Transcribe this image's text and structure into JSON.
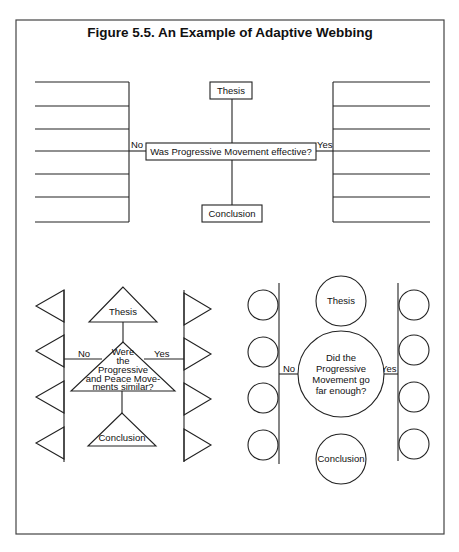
{
  "figure": {
    "title": "Figure 5.5.  An Example of Adaptive Webbing"
  },
  "web_rectangles": {
    "thesis": "Thesis",
    "question": "Was Progressive Movement effective?",
    "conclusion": "Conclusion",
    "no_label": "No",
    "yes_label": "Yes",
    "left_lines_count": 7,
    "right_lines_count": 7
  },
  "web_triangles": {
    "thesis": "Thesis",
    "question_lines": [
      "Were",
      "the",
      "Progressive",
      "and Peace Move-",
      "ments similar?"
    ],
    "conclusion": "Conclusion",
    "no_label": "No",
    "yes_label": "Yes",
    "left_triangles_count": 4,
    "right_triangles_count": 4
  },
  "web_circles": {
    "thesis": "Thesis",
    "question_lines": [
      "Did the",
      "Progressive",
      "Movement go",
      "far enough?"
    ],
    "conclusion": "Conclusion",
    "no_label": "No",
    "yes_label": "Yes",
    "left_circles_count": 4,
    "right_circles_count": 4
  },
  "colors": {
    "ink": "#222222",
    "background": "#ffffff"
  }
}
